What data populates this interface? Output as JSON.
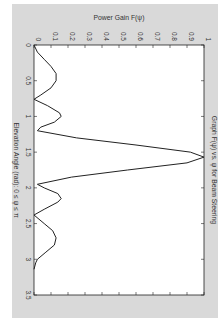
{
  "chart_data": {
    "type": "line",
    "title": "Graph F(ψ) vs. ψ for Beam Steering",
    "xlabel": "Elevation Angle (rad): 0 ≤ ψ ≤ π",
    "ylabel": "Power Gain F(ψ)",
    "orientation": "rotated-90-clockwise",
    "xlim": [
      0,
      3.5
    ],
    "ylim": [
      0,
      1
    ],
    "xticks": [
      "0",
      "0.5",
      "1",
      "1.5",
      "2",
      "2.5",
      "3",
      "3.5"
    ],
    "yticks": [
      "0",
      "0.1",
      "0.2",
      "0.3",
      "0.4",
      "0.5",
      "0.6",
      "0.7",
      "0.8",
      "0.9",
      "1"
    ],
    "grid": false,
    "series": [
      {
        "name": "F(ψ)",
        "x": [
          0,
          0.1,
          0.2,
          0.3,
          0.4,
          0.5,
          0.6,
          0.7,
          0.76,
          0.85,
          0.95,
          1.0,
          1.08,
          1.15,
          1.2,
          1.3,
          1.4,
          1.5,
          1.57,
          1.65,
          1.75,
          1.85,
          1.95,
          2.0,
          2.08,
          2.15,
          2.2,
          2.3,
          2.38,
          2.5,
          2.6,
          2.7,
          2.8,
          2.9,
          3.0,
          3.05,
          3.14
        ],
        "y": [
          0.0,
          0.02,
          0.06,
          0.1,
          0.13,
          0.13,
          0.1,
          0.04,
          0.0,
          0.08,
          0.15,
          0.16,
          0.12,
          0.04,
          0.02,
          0.25,
          0.6,
          0.92,
          1.0,
          0.9,
          0.55,
          0.22,
          0.02,
          0.06,
          0.14,
          0.16,
          0.14,
          0.06,
          0.0,
          0.06,
          0.11,
          0.13,
          0.12,
          0.07,
          0.02,
          0.01,
          0.0
        ]
      }
    ],
    "line_color": "#222222",
    "background_color": "#d8d8d8",
    "plot_background": "#ffffff"
  }
}
